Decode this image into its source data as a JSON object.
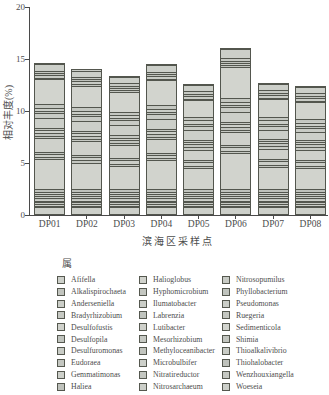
{
  "chart_data": {
    "type": "bar",
    "stacked": true,
    "title": "",
    "xlabel": "滨海区采样点",
    "ylabel": "相对丰度(%)",
    "legend_title": "属",
    "legend_position": "bottom",
    "legend_columns": 3,
    "grid": false,
    "ylim": [
      0,
      20
    ],
    "yticks": [
      0,
      5,
      10,
      15,
      20
    ],
    "categories": [
      "DP01",
      "DP02",
      "DP03",
      "DP04",
      "DP05",
      "DP06",
      "DP07",
      "DP08"
    ],
    "totals": [
      14.4,
      13.8,
      13.2,
      14.3,
      12.4,
      15.9,
      12.5,
      12.2
    ],
    "bar_fill_note": "grayscale figure: all segments light gray-green with dark boundary lines",
    "axis_color": "#4a4a4a",
    "segment_border_color": "#53564e",
    "series": [
      {
        "name": "Afifella",
        "color": "#cdd0ca",
        "values": [
          0.7,
          0.7,
          0.7,
          0.7,
          0.7,
          0.7,
          0.7,
          0.7
        ]
      },
      {
        "name": "Alkalispirochaeta",
        "color": "#c2c5bf",
        "values": [
          0.12,
          0.12,
          0.12,
          0.12,
          0.12,
          0.12,
          0.12,
          0.12
        ]
      },
      {
        "name": "Anderseniella",
        "color": "#cbcec8",
        "values": [
          0.15,
          0.15,
          0.15,
          0.15,
          0.15,
          0.15,
          0.15,
          0.15
        ]
      },
      {
        "name": "Bradyrhizobium",
        "color": "#c6c9c3",
        "values": [
          0.18,
          0.18,
          0.18,
          0.18,
          0.18,
          0.18,
          0.18,
          0.18
        ]
      },
      {
        "name": "Desulfofustis",
        "color": "#d0d2cc",
        "values": [
          0.15,
          0.15,
          0.15,
          0.15,
          0.15,
          0.15,
          0.15,
          0.15
        ]
      },
      {
        "name": "Desulfopila",
        "color": "#c0c4be",
        "values": [
          0.25,
          0.25,
          0.25,
          0.25,
          0.25,
          0.25,
          0.25,
          0.25
        ]
      },
      {
        "name": "Desulfuromonas",
        "color": "#c9ccc6",
        "values": [
          0.2,
          0.2,
          0.2,
          0.2,
          0.2,
          0.2,
          0.2,
          0.2
        ]
      },
      {
        "name": "Eudoraea",
        "color": "#c4c7c1",
        "values": [
          0.15,
          0.15,
          0.15,
          0.15,
          0.15,
          0.15,
          0.15,
          0.15
        ]
      },
      {
        "name": "Gemmatimonas",
        "color": "#cdd0ca",
        "values": [
          0.25,
          0.25,
          0.25,
          0.25,
          0.25,
          0.25,
          0.25,
          0.25
        ]
      },
      {
        "name": "Haliea",
        "color": "#bfc2bc",
        "values": [
          0.3,
          0.3,
          0.3,
          0.3,
          0.3,
          0.3,
          0.3,
          0.3
        ]
      },
      {
        "name": "Halioglobus",
        "color": "#d1d3cd",
        "values": [
          2.8,
          2.5,
          2.2,
          2.7,
          2.0,
          3.4,
          2.1,
          2.0
        ]
      },
      {
        "name": "Hyphomicrobium",
        "color": "#c4c7c1",
        "values": [
          0.2,
          0.2,
          0.2,
          0.2,
          0.2,
          0.2,
          0.2,
          0.2
        ]
      },
      {
        "name": "Ilumatobacter",
        "color": "#cbcec8",
        "values": [
          0.35,
          0.35,
          0.35,
          0.35,
          0.35,
          0.35,
          0.35,
          0.35
        ]
      },
      {
        "name": "Labrenzia",
        "color": "#c0c4be",
        "values": [
          0.2,
          0.2,
          0.2,
          0.2,
          0.2,
          0.2,
          0.2,
          0.2
        ]
      },
      {
        "name": "Lutibacter",
        "color": "#cfd1cb",
        "values": [
          1.3,
          1.3,
          1.2,
          1.3,
          1.0,
          1.3,
          1.0,
          1.0
        ]
      },
      {
        "name": "Mesorhizobium",
        "color": "#c6c9c3",
        "values": [
          0.2,
          0.2,
          0.2,
          0.2,
          0.2,
          0.2,
          0.2,
          0.2
        ]
      },
      {
        "name": "Methyloceanibacter",
        "color": "#c2c5bf",
        "values": [
          0.3,
          0.3,
          0.3,
          0.3,
          0.3,
          0.3,
          0.3,
          0.3
        ]
      },
      {
        "name": "Microbulbifer",
        "color": "#cdd0ca",
        "values": [
          0.25,
          0.25,
          0.25,
          0.25,
          0.25,
          0.25,
          0.25,
          0.25
        ]
      },
      {
        "name": "Nitratireductor",
        "color": "#c4c7c1",
        "values": [
          0.2,
          0.2,
          0.2,
          0.2,
          0.2,
          0.2,
          0.2,
          0.2
        ]
      },
      {
        "name": "Nitrosarchaeum",
        "color": "#cccfc9",
        "values": [
          1.0,
          1.0,
          1.0,
          1.0,
          0.9,
          1.0,
          0.8,
          0.7
        ]
      },
      {
        "name": "Nitrosopumilus",
        "color": "#c8cbc5",
        "values": [
          0.45,
          0.45,
          0.45,
          0.45,
          0.45,
          0.45,
          0.45,
          0.45
        ]
      },
      {
        "name": "Phyllobacterium",
        "color": "#c0c4be",
        "values": [
          0.2,
          0.2,
          0.2,
          0.2,
          0.2,
          0.2,
          0.2,
          0.2
        ]
      },
      {
        "name": "Pseudomonas",
        "color": "#cbcec8",
        "values": [
          0.3,
          0.3,
          0.3,
          0.3,
          0.3,
          0.3,
          0.3,
          0.3
        ]
      },
      {
        "name": "Ruegeria",
        "color": "#c4c7c1",
        "values": [
          0.35,
          0.35,
          0.35,
          0.35,
          0.35,
          0.35,
          0.35,
          0.35
        ]
      },
      {
        "name": "Sedimenticola",
        "color": "#d2d4ce",
        "values": [
          2.4,
          2.1,
          1.9,
          2.4,
          1.6,
          3.0,
          1.7,
          1.6
        ]
      },
      {
        "name": "Shimia",
        "color": "#c2c5bf",
        "values": [
          0.15,
          0.15,
          0.15,
          0.15,
          0.15,
          0.15,
          0.15,
          0.15
        ]
      },
      {
        "name": "Thioalkalivibrio",
        "color": "#c9ccc6",
        "values": [
          0.25,
          0.25,
          0.25,
          0.25,
          0.25,
          0.25,
          0.25,
          0.25
        ]
      },
      {
        "name": "Thiohalobacter",
        "color": "#bfc2bc",
        "values": [
          0.2,
          0.2,
          0.2,
          0.2,
          0.2,
          0.2,
          0.2,
          0.2
        ]
      },
      {
        "name": "Wenzhouxiangella",
        "color": "#c6c9c3",
        "values": [
          0.25,
          0.25,
          0.25,
          0.25,
          0.25,
          0.25,
          0.25,
          0.25
        ]
      },
      {
        "name": "Woeseia",
        "color": "#cccfc9",
        "values": [
          0.6,
          0.6,
          0.6,
          0.6,
          0.6,
          0.9,
          0.6,
          0.6
        ]
      }
    ]
  }
}
